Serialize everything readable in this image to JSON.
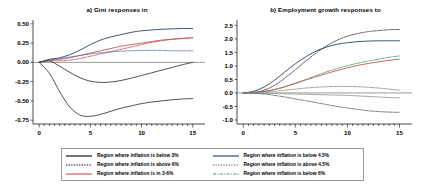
{
  "figure": {
    "panels": [
      {
        "id": "a",
        "title": "a) Gini responses in",
        "ylim": [
          -0.8,
          0.55
        ],
        "yticks": [
          "0.50",
          "0.25",
          "0.00",
          "-0.25",
          "-0.50",
          "-0.75"
        ],
        "ytick_values": [
          0.5,
          0.25,
          0.0,
          -0.25,
          -0.5,
          -0.75
        ],
        "xlim": [
          -0.6,
          16.2
        ],
        "xticks": [
          "0",
          "5",
          "10",
          "15"
        ],
        "xtick_values": [
          0,
          5,
          10,
          15
        ]
      },
      {
        "id": "b",
        "title": "b) Employment growth responses to",
        "ylim": [
          -1.15,
          2.7
        ],
        "yticks": [
          "2.5",
          "2.0",
          "1.5",
          "1.0",
          "0.5",
          "0.0",
          "-0.5",
          "-1.0"
        ],
        "ytick_values": [
          2.5,
          2.0,
          1.5,
          1.0,
          0.5,
          0.0,
          -0.5,
          -1.0
        ],
        "xlim": [
          -0.6,
          16.2
        ],
        "xticks": [
          "0",
          "5",
          "10",
          "15"
        ],
        "xtick_values": [
          0,
          5,
          10,
          15
        ]
      }
    ]
  },
  "legend": {
    "left_column": [
      {
        "label": "Region where inflation is below 3%",
        "color": "#000000",
        "style": "solid"
      },
      {
        "label": "Region where inflation is above 6%",
        "color": "#000000",
        "style": "dotted"
      },
      {
        "label": "Region where inflation is in 3-6%",
        "color": "#c0504d",
        "style": "solid"
      }
    ],
    "right_column": [
      {
        "label": "Region where inflation is below 4.5%",
        "color": "#1f3864",
        "style": "solid"
      },
      {
        "label": "Region where inflation is above 4.5%",
        "color": "#555555",
        "style": "dotted"
      },
      {
        "label": "Region where inflation is below 6%",
        "color": "#4e9a6a",
        "style": "dashdot"
      }
    ]
  },
  "chart_data": {
    "type": "line",
    "panels": [
      {
        "id": "a",
        "title": "a) Gini responses in",
        "xlabel": "",
        "ylabel": "",
        "xlim": [
          0,
          15
        ],
        "ylim": [
          -0.8,
          0.55
        ],
        "grid": false,
        "legend_position": "below-figure",
        "x": [
          0,
          1,
          2,
          3,
          4,
          5,
          6,
          7,
          8,
          9,
          10,
          11,
          12,
          13,
          14,
          15
        ],
        "series": [
          {
            "name": "Region where inflation is below 3%",
            "color": "#1f3864",
            "style": "solid",
            "values": [
              0.0,
              0.04,
              0.06,
              0.1,
              0.16,
              0.23,
              0.29,
              0.33,
              0.36,
              0.39,
              0.41,
              0.42,
              0.43,
              0.435,
              0.44,
              0.44
            ]
          },
          {
            "name": "Region where inflation is in 3-6%",
            "color": "#c0504d",
            "style": "solid",
            "values": [
              0.0,
              0.03,
              0.04,
              0.06,
              0.09,
              0.12,
              0.15,
              0.18,
              0.21,
              0.23,
              0.25,
              0.27,
              0.29,
              0.3,
              0.31,
              0.32
            ]
          },
          {
            "name": "Region where inflation is below 6%",
            "color": "#c0504d",
            "style": "dashdot",
            "values": [
              0.0,
              0.02,
              0.02,
              0.03,
              0.05,
              0.08,
              0.11,
              0.14,
              0.17,
              0.2,
              0.23,
              0.26,
              0.28,
              0.3,
              0.31,
              0.32
            ]
          },
          {
            "name": "Region where inflation is above 4.5%",
            "color": "#4a6fa5",
            "style": "dotted",
            "values": [
              0.0,
              0.03,
              0.05,
              0.07,
              0.09,
              0.11,
              0.125,
              0.135,
              0.145,
              0.15,
              0.155,
              0.155,
              0.155,
              0.15,
              0.15,
              0.15
            ]
          },
          {
            "name": "Region where inflation is above 6%",
            "color": "#333333",
            "style": "solid",
            "values": [
              0.0,
              0.02,
              -0.05,
              -0.13,
              -0.2,
              -0.245,
              -0.26,
              -0.255,
              -0.235,
              -0.205,
              -0.17,
              -0.135,
              -0.1,
              -0.065,
              -0.03,
              0.0
            ]
          },
          {
            "name": "Region where inflation is below 4.5%",
            "color": "#333333",
            "style": "solid",
            "values": [
              0.0,
              -0.14,
              -0.38,
              -0.58,
              -0.685,
              -0.7,
              -0.675,
              -0.635,
              -0.595,
              -0.565,
              -0.535,
              -0.515,
              -0.5,
              -0.485,
              -0.475,
              -0.47
            ]
          }
        ]
      },
      {
        "id": "b",
        "title": "b) Employment growth responses to",
        "xlabel": "",
        "ylabel": "",
        "xlim": [
          0,
          15
        ],
        "ylim": [
          -1.15,
          2.7
        ],
        "grid": false,
        "legend_position": "below-figure",
        "x": [
          0,
          1,
          2,
          3,
          4,
          5,
          6,
          7,
          8,
          9,
          10,
          11,
          12,
          13,
          14,
          15
        ],
        "series": [
          {
            "name": "Region where inflation is above 6%",
            "color": "#333333",
            "style": "dotted",
            "values": [
              0.0,
              0.02,
              0.1,
              0.28,
              0.55,
              0.86,
              1.18,
              1.48,
              1.74,
              1.95,
              2.1,
              2.2,
              2.27,
              2.31,
              2.34,
              2.35
            ]
          },
          {
            "name": "Region where inflation is below 3%",
            "color": "#1f3864",
            "style": "solid",
            "values": [
              0.0,
              0.06,
              0.22,
              0.47,
              0.78,
              1.08,
              1.34,
              1.55,
              1.7,
              1.8,
              1.86,
              1.9,
              1.92,
              1.93,
              1.93,
              1.93
            ]
          },
          {
            "name": "Region where inflation is below 6%",
            "color": "#4e9a6a",
            "style": "dashdot",
            "values": [
              0.0,
              0.01,
              0.05,
              0.12,
              0.23,
              0.36,
              0.5,
              0.64,
              0.78,
              0.9,
              1.01,
              1.1,
              1.18,
              1.25,
              1.32,
              1.37
            ]
          },
          {
            "name": "Region where inflation is in 3-6%",
            "color": "#c0504d",
            "style": "solid",
            "values": [
              0.0,
              0.02,
              0.06,
              0.13,
              0.23,
              0.35,
              0.48,
              0.6,
              0.72,
              0.83,
              0.93,
              1.02,
              1.09,
              1.15,
              1.21,
              1.25
            ]
          },
          {
            "name": "Region where inflation is above 4.5%",
            "color": "#7f7f7f",
            "style": "dotted",
            "values": [
              0.0,
              0.01,
              0.03,
              0.06,
              0.1,
              0.14,
              0.18,
              0.21,
              0.23,
              0.24,
              0.24,
              0.23,
              0.21,
              0.18,
              0.14,
              0.1
            ]
          },
          {
            "name": "Region where inflation is below 4.5%",
            "color": "#9a9a9a",
            "style": "solid",
            "values": [
              0.0,
              0.0,
              -0.01,
              -0.02,
              -0.03,
              -0.04,
              -0.05,
              -0.06,
              -0.07,
              -0.08,
              -0.09,
              -0.11,
              -0.13,
              -0.15,
              -0.17,
              -0.18
            ]
          },
          {
            "name": "Region where inflation is above 4.5% (lower)",
            "color": "#555555",
            "style": "dotted",
            "values": [
              0.0,
              -0.01,
              -0.04,
              -0.09,
              -0.15,
              -0.22,
              -0.29,
              -0.36,
              -0.43,
              -0.5,
              -0.56,
              -0.61,
              -0.66,
              -0.69,
              -0.71,
              -0.72
            ]
          }
        ]
      }
    ]
  }
}
